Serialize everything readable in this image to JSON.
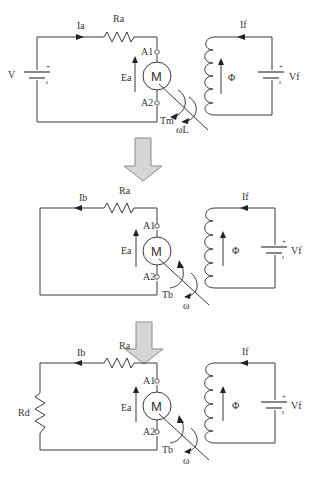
{
  "figure": {
    "transition_arrow_color": "#d6d6d6",
    "stages": [
      {
        "id": "motoring",
        "armature": {
          "source_label": "V",
          "source_plus": "+",
          "source_minus": "ı",
          "current_label": "Ia",
          "current_direction": "right",
          "resistor_label": "Ra",
          "emf_label": "Ea",
          "terminal_top": "A1",
          "terminal_bottom": "A2",
          "machine_label": "M",
          "torque_label": "Tm",
          "speed_label": "ωL"
        },
        "field": {
          "current_label": "If",
          "flux_label": "Φ",
          "source_label": "Vf",
          "source_plus": "+",
          "source_minus": "ı"
        }
      },
      {
        "id": "braking-short",
        "armature": {
          "current_label": "Ib",
          "current_direction": "left",
          "resistor_label": "Ra",
          "emf_label": "Ea",
          "terminal_top": "A1",
          "terminal_bottom": "A2",
          "machine_label": "M",
          "torque_label": "Tb",
          "speed_label": "ω"
        },
        "field": {
          "current_label": "If",
          "flux_label": "Φ",
          "source_label": "Vf",
          "source_plus": "+",
          "source_minus": "ı"
        }
      },
      {
        "id": "dynamic-braking",
        "armature": {
          "braking_resistor_label": "Rd",
          "current_label": "Ib",
          "current_direction": "left",
          "resistor_label": "Ra",
          "emf_label": "Ea",
          "terminal_top": "A1",
          "terminal_bottom": "A2",
          "machine_label": "M",
          "torque_label": "Tb",
          "speed_label": "ω"
        },
        "field": {
          "current_label": "If",
          "flux_label": "Φ",
          "source_label": "Vf",
          "source_plus": "+",
          "source_minus": "ı"
        }
      }
    ]
  }
}
